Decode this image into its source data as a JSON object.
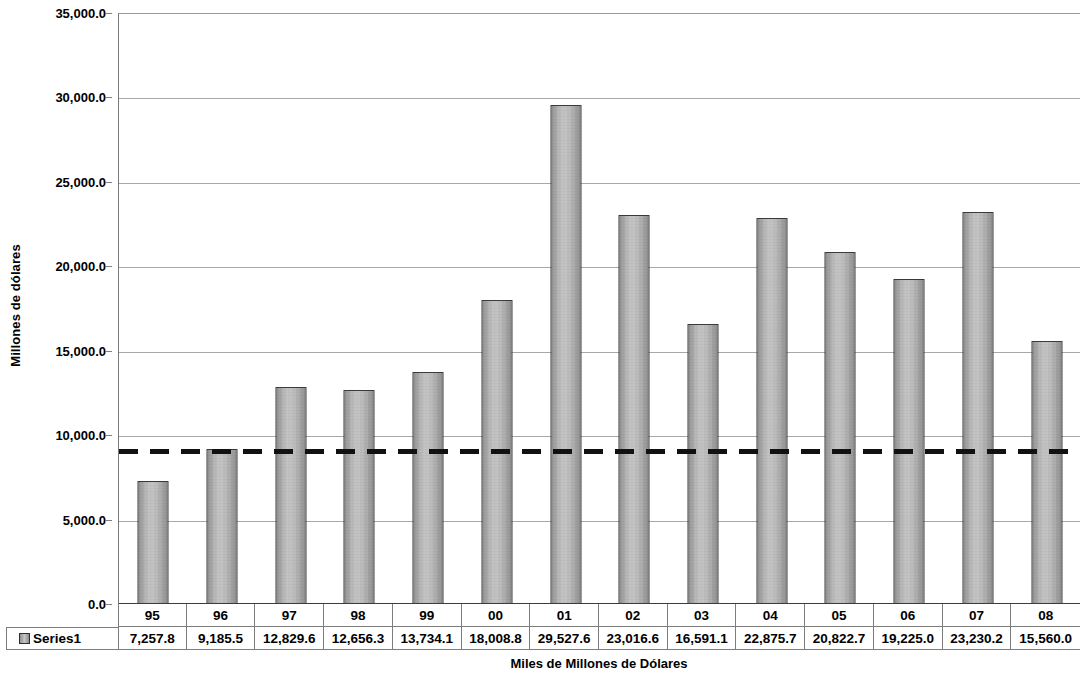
{
  "chart_data": {
    "type": "bar",
    "title": "",
    "xlabel": "Miles de Millones de Dólares",
    "ylabel": "Millones de dólares",
    "categories": [
      "95",
      "96",
      "97",
      "98",
      "99",
      "00",
      "01",
      "02",
      "03",
      "04",
      "05",
      "06",
      "07",
      "08"
    ],
    "series": [
      {
        "name": "Series1",
        "values": [
          7257.8,
          9185.5,
          12829.6,
          12656.3,
          13734.1,
          18008.8,
          29527.6,
          23016.6,
          16591.1,
          22875.7,
          20822.7,
          19225.0,
          23230.2,
          15560.0
        ],
        "value_labels": [
          "7,257.8",
          "9,185.5",
          "12,829.6",
          "12,656.3",
          "13,734.1",
          "18,008.8",
          "29,527.6",
          "23,016.6",
          "16,591.1",
          "22,875.7",
          "20,822.7",
          "19,225.0",
          "23,230.2",
          "15,560.0"
        ]
      }
    ],
    "ylim": [
      0,
      35000
    ],
    "ytick_values": [
      0,
      5000,
      10000,
      15000,
      20000,
      25000,
      30000,
      35000
    ],
    "ytick_labels": [
      "0.0",
      "5,000.0",
      "10,000.0",
      "15,000.0",
      "20,000.0",
      "25,000.0",
      "30,000.0",
      "35,000.0"
    ],
    "grid": true,
    "legend_position": "data-table-left",
    "annotations": [
      {
        "name": "reference-line",
        "type": "horizontal-dashed-line",
        "value": 9100,
        "style": "dashed",
        "color": "#111111"
      }
    ],
    "data_table": {
      "visible": true,
      "legend_label": "Series1",
      "header_row": [
        "95",
        "96",
        "97",
        "98",
        "99",
        "00",
        "01",
        "02",
        "03",
        "04",
        "05",
        "06",
        "07",
        "08"
      ],
      "value_row": [
        "7,257.8",
        "9,185.5",
        "12,829.6",
        "12,656.3",
        "13,734.1",
        "18,008.8",
        "29,527.6",
        "23,016.6",
        "16,591.1",
        "22,875.7",
        "20,822.7",
        "19,225.0",
        "23,230.2",
        "15,560.0"
      ]
    },
    "colors": {
      "bar_fill": "#b9b9b9",
      "bar_border": "#3a3a3a",
      "gridline": "#a8a8a8",
      "axis": "#3c3c3c",
      "reference_line": "#111111",
      "text": "#000000"
    }
  }
}
